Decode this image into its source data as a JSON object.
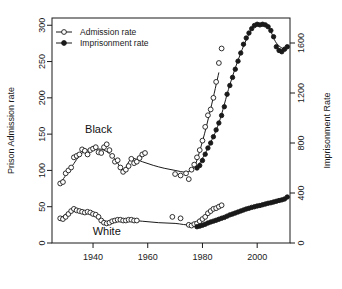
{
  "chart_data": {
    "type": "scatter",
    "title": "",
    "subtitle": "",
    "xlabel": "",
    "ylabel": "Prison Admission rate",
    "y2label": "Imprisonment Rate",
    "xlim": [
      1925,
      2012
    ],
    "ylim": [
      0,
      310
    ],
    "y2lim": [
      0,
      1800
    ],
    "grid": false,
    "legend": {
      "position": "top-left",
      "entries": [
        {
          "label": "Admission rate",
          "marker": "open-circle",
          "line": true,
          "color": "#1a1a1a"
        },
        {
          "label": "Imprisonment rate",
          "marker": "filled-circle",
          "line": true,
          "color": "#1a1a1a"
        }
      ]
    },
    "xticks": [
      1940,
      1960,
      1980,
      2000
    ],
    "xtick_labels": [
      "1940",
      "1960",
      "1980",
      "2000"
    ],
    "yticks": [
      0,
      50,
      100,
      150,
      200,
      250,
      300
    ],
    "ytick_labels": [
      "0",
      "50",
      "100",
      "150",
      "200",
      "250",
      "300"
    ],
    "y2ticks": [
      0,
      400,
      800,
      1200,
      1600
    ],
    "y2tick_labels": [
      "0",
      "400",
      "800",
      "1200",
      "1600"
    ],
    "annotations": [
      {
        "text": "Black",
        "x": 1942,
        "y": 152
      },
      {
        "text": "White",
        "x": 1945,
        "y": 11
      }
    ],
    "series": [
      {
        "name": "Black admission rate",
        "axis": "left",
        "marker": "open-circle",
        "smooth_line": true,
        "points": [
          [
            1928,
            82
          ],
          [
            1929,
            84
          ],
          [
            1930,
            96
          ],
          [
            1931,
            100
          ],
          [
            1932,
            104
          ],
          [
            1933,
            118
          ],
          [
            1934,
            120
          ],
          [
            1935,
            122
          ],
          [
            1936,
            129
          ],
          [
            1937,
            127
          ],
          [
            1938,
            122
          ],
          [
            1939,
            128
          ],
          [
            1940,
            130
          ],
          [
            1941,
            132
          ],
          [
            1942,
            125
          ],
          [
            1943,
            124
          ],
          [
            1944,
            132
          ],
          [
            1945,
            136
          ],
          [
            1946,
            128
          ],
          [
            1947,
            120
          ],
          [
            1948,
            112
          ],
          [
            1949,
            114
          ],
          [
            1950,
            104
          ],
          [
            1951,
            98
          ],
          [
            1952,
            101
          ],
          [
            1953,
            106
          ],
          [
            1954,
            116
          ],
          [
            1955,
            110
          ],
          [
            1956,
            112
          ],
          [
            1957,
            117
          ],
          [
            1958,
            122
          ],
          [
            1959,
            124
          ],
          [
            1970,
            95
          ],
          [
            1972,
            93
          ],
          [
            1974,
            96
          ],
          [
            1975,
            88
          ],
          [
            1976,
            101
          ],
          [
            1977,
            108
          ],
          [
            1978,
            118
          ],
          [
            1979,
            128
          ],
          [
            1980,
            141
          ],
          [
            1981,
            160
          ],
          [
            1982,
            176
          ],
          [
            1983,
            184
          ],
          [
            1984,
            200
          ],
          [
            1985,
            222
          ],
          [
            1986,
            248
          ],
          [
            1987,
            268
          ]
        ],
        "smooth": [
          [
            1928,
            82
          ],
          [
            1932,
            104
          ],
          [
            1936,
            124
          ],
          [
            1940,
            129
          ],
          [
            1944,
            128
          ],
          [
            1948,
            116
          ],
          [
            1951,
            100
          ],
          [
            1954,
            116
          ],
          [
            1958,
            112
          ],
          [
            1962,
            107
          ],
          [
            1966,
            103
          ],
          [
            1970,
            100
          ],
          [
            1974,
            98
          ],
          [
            1977,
            105
          ],
          [
            1980,
            140
          ],
          [
            1983,
            185
          ],
          [
            1986,
            235
          ]
        ]
      },
      {
        "name": "White admission rate",
        "axis": "left",
        "marker": "open-circle",
        "smooth_line": true,
        "points": [
          [
            1928,
            34
          ],
          [
            1929,
            33
          ],
          [
            1930,
            36
          ],
          [
            1931,
            40
          ],
          [
            1932,
            44
          ],
          [
            1933,
            47
          ],
          [
            1934,
            45
          ],
          [
            1935,
            44
          ],
          [
            1936,
            43
          ],
          [
            1937,
            42
          ],
          [
            1938,
            43
          ],
          [
            1939,
            42
          ],
          [
            1940,
            40
          ],
          [
            1941,
            39
          ],
          [
            1942,
            36
          ],
          [
            1943,
            31
          ],
          [
            1944,
            28
          ],
          [
            1945,
            27
          ],
          [
            1946,
            28
          ],
          [
            1947,
            30
          ],
          [
            1948,
            31
          ],
          [
            1949,
            32
          ],
          [
            1950,
            32
          ],
          [
            1951,
            31
          ],
          [
            1952,
            31
          ],
          [
            1953,
            32
          ],
          [
            1954,
            32
          ],
          [
            1955,
            31
          ],
          [
            1956,
            31
          ],
          [
            1969,
            36
          ],
          [
            1972,
            34
          ],
          [
            1975,
            25
          ],
          [
            1976,
            24
          ],
          [
            1977,
            26
          ],
          [
            1978,
            27
          ],
          [
            1979,
            30
          ],
          [
            1980,
            33
          ],
          [
            1981,
            36
          ],
          [
            1982,
            41
          ],
          [
            1983,
            44
          ],
          [
            1984,
            47
          ],
          [
            1985,
            48
          ],
          [
            1986,
            50
          ],
          [
            1987,
            52
          ]
        ],
        "smooth": [
          [
            1928,
            34
          ],
          [
            1932,
            44
          ],
          [
            1936,
            44
          ],
          [
            1940,
            40
          ],
          [
            1944,
            28
          ],
          [
            1948,
            31
          ],
          [
            1952,
            32
          ],
          [
            1958,
            30
          ],
          [
            1964,
            28
          ],
          [
            1970,
            27
          ],
          [
            1976,
            25
          ],
          [
            1980,
            33
          ],
          [
            1984,
            46
          ],
          [
            1987,
            52
          ]
        ]
      },
      {
        "name": "Black imprisonment rate",
        "axis": "right",
        "marker": "filled-circle",
        "smooth_line": true,
        "points": [
          [
            1978,
            600
          ],
          [
            1979,
            620
          ],
          [
            1980,
            660
          ],
          [
            1981,
            710
          ],
          [
            1982,
            760
          ],
          [
            1983,
            800
          ],
          [
            1984,
            850
          ],
          [
            1985,
            905
          ],
          [
            1986,
            960
          ],
          [
            1987,
            1020
          ],
          [
            1988,
            1090
          ],
          [
            1989,
            1190
          ],
          [
            1990,
            1260
          ],
          [
            1991,
            1325
          ],
          [
            1992,
            1390
          ],
          [
            1993,
            1455
          ],
          [
            1994,
            1520
          ],
          [
            1995,
            1590
          ],
          [
            1996,
            1640
          ],
          [
            1997,
            1680
          ],
          [
            1998,
            1715
          ],
          [
            1999,
            1740
          ],
          [
            2000,
            1750
          ],
          [
            2001,
            1745
          ],
          [
            2002,
            1750
          ],
          [
            2003,
            1745
          ],
          [
            2004,
            1730
          ],
          [
            2005,
            1700
          ],
          [
            2006,
            1650
          ],
          [
            2007,
            1570
          ],
          [
            2008,
            1540
          ],
          [
            2009,
            1530
          ],
          [
            2010,
            1550
          ],
          [
            2011,
            1570
          ]
        ],
        "smooth": [
          [
            1978,
            600
          ],
          [
            1982,
            760
          ],
          [
            1986,
            960
          ],
          [
            1990,
            1265
          ],
          [
            1994,
            1520
          ],
          [
            1998,
            1710
          ],
          [
            2001,
            1750
          ],
          [
            2004,
            1730
          ],
          [
            2007,
            1600
          ],
          [
            2010,
            1545
          ]
        ]
      },
      {
        "name": "White imprisonment rate",
        "axis": "right",
        "marker": "filled-circle",
        "smooth_line": true,
        "points": [
          [
            1978,
            130
          ],
          [
            1979,
            135
          ],
          [
            1980,
            142
          ],
          [
            1981,
            150
          ],
          [
            1982,
            160
          ],
          [
            1983,
            168
          ],
          [
            1984,
            175
          ],
          [
            1985,
            182
          ],
          [
            1986,
            190
          ],
          [
            1987,
            198
          ],
          [
            1988,
            205
          ],
          [
            1989,
            215
          ],
          [
            1990,
            225
          ],
          [
            1991,
            232
          ],
          [
            1992,
            240
          ],
          [
            1993,
            248
          ],
          [
            1994,
            256
          ],
          [
            1995,
            264
          ],
          [
            1996,
            272
          ],
          [
            1997,
            278
          ],
          [
            1998,
            285
          ],
          [
            1999,
            290
          ],
          [
            2000,
            296
          ],
          [
            2001,
            300
          ],
          [
            2002,
            306
          ],
          [
            2003,
            312
          ],
          [
            2004,
            318
          ],
          [
            2005,
            322
          ],
          [
            2006,
            328
          ],
          [
            2007,
            334
          ],
          [
            2008,
            340
          ],
          [
            2009,
            345
          ],
          [
            2010,
            352
          ],
          [
            2011,
            368
          ]
        ],
        "smooth": [
          [
            1978,
            130
          ],
          [
            1983,
            168
          ],
          [
            1988,
            205
          ],
          [
            1993,
            248
          ],
          [
            1998,
            285
          ],
          [
            2003,
            312
          ],
          [
            2008,
            340
          ],
          [
            2011,
            368
          ]
        ]
      }
    ]
  }
}
